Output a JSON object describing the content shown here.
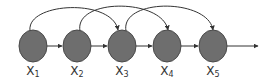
{
  "diagram": {
    "type": "directed-graph",
    "colors": {
      "node_fill": "#6e6e6e",
      "node_stroke": "#4a4a4a",
      "edge": "#333333",
      "label": "#333333"
    },
    "nodes": [
      {
        "id": "x1",
        "label": "X",
        "subscript": "1",
        "cx": 33,
        "cy": 46
      },
      {
        "id": "x2",
        "label": "X",
        "subscript": "2",
        "cx": 77,
        "cy": 46
      },
      {
        "id": "x3",
        "label": "X",
        "subscript": "3",
        "cx": 122,
        "cy": 46
      },
      {
        "id": "x4",
        "label": "X",
        "subscript": "4",
        "cx": 167,
        "cy": 46
      },
      {
        "id": "x5",
        "label": "X",
        "subscript": "5",
        "cx": 213,
        "cy": 46
      }
    ],
    "edges": [
      {
        "from": "x1",
        "to": "x2",
        "kind": "straight"
      },
      {
        "from": "x2",
        "to": "x3",
        "kind": "straight"
      },
      {
        "from": "x3",
        "to": "x4",
        "kind": "straight"
      },
      {
        "from": "x4",
        "to": "x5",
        "kind": "straight"
      },
      {
        "from": "x5",
        "to": "output",
        "kind": "straight"
      },
      {
        "from": "x1",
        "to": "x3",
        "kind": "arc"
      },
      {
        "from": "x2",
        "to": "x4",
        "kind": "arc"
      },
      {
        "from": "x3",
        "to": "x5",
        "kind": "arc"
      }
    ]
  }
}
